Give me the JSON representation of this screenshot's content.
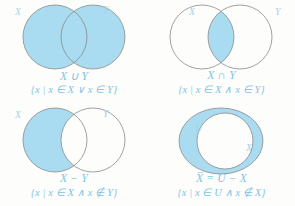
{
  "figure": {
    "fill_color": "#A9DCF1",
    "stroke_color": "#8a8a8a",
    "label_color": "#9ed3ea",
    "caption_color": "#7ec4e2",
    "background": "#fdfdfc"
  },
  "panels": [
    {
      "id": "union",
      "operation_label": "X ∪ Y",
      "set_builder": "{x | x ∈ X ∨ x ∈ Y}",
      "left_circle_label": "X",
      "right_circle_label": "Y",
      "shaded_region": "both-circles"
    },
    {
      "id": "intersection",
      "operation_label": "X ∩ Y",
      "set_builder": "{x | x ∈ X ∧ x ∈ Y}",
      "left_circle_label": "X",
      "right_circle_label": "Y",
      "shaded_region": "lens-only"
    },
    {
      "id": "difference",
      "operation_label": "X − Y",
      "set_builder": "{x | x ∈ X ∧ x ∉ Y}",
      "left_circle_label": "X",
      "right_circle_label": "Y",
      "shaded_region": "left-minus-lens"
    },
    {
      "id": "complement",
      "operation_label": "X̅ = U − X",
      "set_builder": "{x | x ∈ U ∧ x ∉ X}",
      "universe_label": "U",
      "inner_circle_label": "X",
      "shaded_region": "ring-outside-inner-circle"
    }
  ]
}
